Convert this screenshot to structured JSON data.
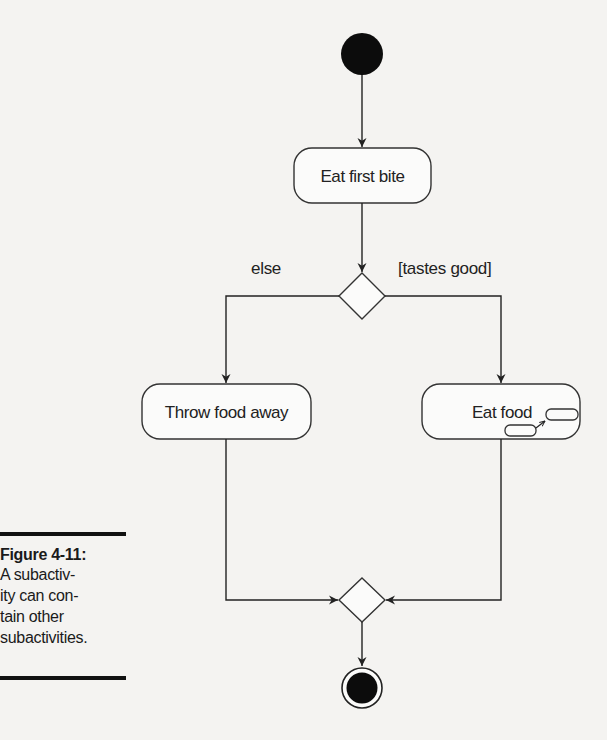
{
  "figure": {
    "label": "Figure 4-11:",
    "caption": "A subactivity can contain other subactivities."
  },
  "caption_lines": [
    "A subactiv-",
    "ity can con-",
    "tain other",
    "subactivities."
  ],
  "diagram": {
    "type": "UML activity diagram",
    "nodes": {
      "start": {
        "kind": "initial-node"
      },
      "eat_first_bite": {
        "kind": "action",
        "label": "Eat first bite"
      },
      "decision": {
        "kind": "decision-node"
      },
      "throw_food_away": {
        "kind": "action",
        "label": "Throw food away"
      },
      "eat_food": {
        "kind": "subactivity",
        "label": "Eat food"
      },
      "merge": {
        "kind": "merge-node"
      },
      "end": {
        "kind": "final-node"
      }
    },
    "guards": {
      "else": "else",
      "tastes_good": "[tastes good]"
    },
    "edges": [
      {
        "from": "start",
        "to": "eat_first_bite"
      },
      {
        "from": "eat_first_bite",
        "to": "decision"
      },
      {
        "from": "decision",
        "to": "throw_food_away",
        "guard": "else"
      },
      {
        "from": "decision",
        "to": "eat_food",
        "guard": "[tastes good]"
      },
      {
        "from": "throw_food_away",
        "to": "merge"
      },
      {
        "from": "eat_food",
        "to": "merge"
      },
      {
        "from": "merge",
        "to": "end"
      }
    ]
  }
}
